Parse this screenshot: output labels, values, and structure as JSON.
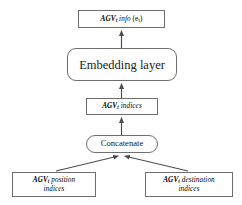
{
  "diagram": {
    "background_color": "#ffffff",
    "line_color": "#4d4d4d",
    "border_color": "#6e6e6e",
    "text_color": "#000000",
    "nodes": {
      "agv_info": {
        "shape": "rectangle",
        "text": "AGV_t info (e_t)",
        "name_part": "AGV",
        "subscript": "t",
        "rest": "info",
        "paren": "(e",
        "paren_sub": "t",
        "paren_close": ")"
      },
      "embedding": {
        "shape": "rounded-rectangle",
        "text": "Embedding layer"
      },
      "agv_indices": {
        "shape": "rectangle",
        "text": "AGV_t indices",
        "name_part": "AGV",
        "subscript": "t",
        "rest": "indices"
      },
      "concatenate": {
        "shape": "rounded-rectangle",
        "text": "Concatenate"
      },
      "agv_position": {
        "shape": "rectangle",
        "text": "AGV_t position indices",
        "name_part": "AGV",
        "subscript": "t",
        "rest": "position",
        "line2": "indices"
      },
      "agv_destination": {
        "shape": "rectangle",
        "text": "AGV_t destination indices",
        "name_part": "AGV",
        "subscript": "t",
        "rest": "destination",
        "line2": "indices"
      }
    },
    "edges": [
      {
        "from": "agv_position",
        "to": "concatenate",
        "style": "solid-arrow",
        "direction": "up-right"
      },
      {
        "from": "agv_destination",
        "to": "concatenate",
        "style": "solid-arrow",
        "direction": "up-left"
      },
      {
        "from": "concatenate",
        "to": "agv_indices",
        "style": "solid-arrow",
        "direction": "up"
      },
      {
        "from": "agv_indices",
        "to": "embedding",
        "style": "solid-arrow",
        "direction": "up"
      },
      {
        "from": "embedding",
        "to": "agv_info",
        "style": "solid-arrow",
        "direction": "up"
      }
    ]
  }
}
